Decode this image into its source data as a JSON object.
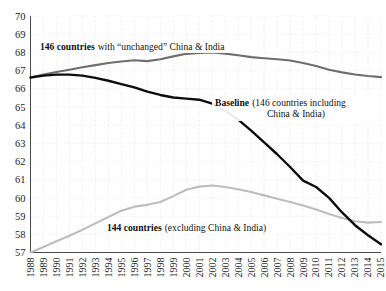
{
  "chart_data": {
    "type": "line",
    "title": "",
    "xlabel": "",
    "ylabel": "",
    "xlim": [
      1988,
      2015
    ],
    "ylim": [
      57,
      70
    ],
    "grid": true,
    "legend_position": "inline-annotations",
    "x": [
      1988,
      1989,
      1990,
      1991,
      1992,
      1993,
      1994,
      1995,
      1996,
      1997,
      1998,
      1999,
      2000,
      2001,
      2002,
      2003,
      2004,
      2005,
      2006,
      2007,
      2008,
      2009,
      2010,
      2011,
      2012,
      2013,
      2014,
      2015
    ],
    "xticklabels": [
      "1988",
      "1989",
      "1990",
      "1991",
      "1992",
      "1993",
      "1994",
      "1995",
      "1996",
      "1997",
      "1998",
      "1999",
      "2000",
      "2001",
      "2002",
      "2003",
      "2004",
      "2005",
      "2006",
      "2007",
      "2008",
      "2009",
      "2010",
      "2011",
      "2012",
      "2013",
      "2014",
      "2015"
    ],
    "yticks": [
      57,
      58,
      59,
      60,
      61,
      62,
      63,
      64,
      65,
      66,
      67,
      68,
      69,
      70
    ],
    "yticklabels": [
      "57",
      "58",
      "59",
      "60",
      "61",
      "62",
      "63",
      "64",
      "65",
      "66",
      "67",
      "68",
      "69",
      "70"
    ],
    "series": [
      {
        "name": "146 countries with \"unchanged\" China & India",
        "color": "#6e6e6e",
        "width": 2.1,
        "values": [
          66.62,
          66.78,
          66.92,
          67.05,
          67.18,
          67.3,
          67.42,
          67.5,
          67.57,
          67.52,
          67.62,
          67.78,
          67.92,
          67.97,
          67.99,
          67.93,
          67.84,
          67.74,
          67.68,
          67.62,
          67.55,
          67.42,
          67.25,
          67.05,
          66.9,
          66.78,
          66.7,
          66.64
        ]
      },
      {
        "name": "Baseline (146 countries including China & India)",
        "color": "#0d0d0d",
        "width": 2.4,
        "values": [
          66.62,
          66.72,
          66.78,
          66.78,
          66.72,
          66.6,
          66.44,
          66.26,
          66.08,
          65.84,
          65.66,
          65.52,
          65.46,
          65.4,
          65.18,
          64.8,
          64.3,
          63.7,
          63.05,
          62.4,
          61.7,
          60.95,
          60.6,
          60.0,
          59.2,
          58.5,
          57.95,
          57.45
        ]
      },
      {
        "name": "144 countries (excluding China & India)",
        "color": "#bdbdbd",
        "width": 2.1,
        "values": [
          57.0,
          57.3,
          57.62,
          57.92,
          58.25,
          58.6,
          58.95,
          59.3,
          59.52,
          59.62,
          59.78,
          60.1,
          60.45,
          60.62,
          60.68,
          60.6,
          60.48,
          60.32,
          60.14,
          59.96,
          59.78,
          59.58,
          59.36,
          59.12,
          58.9,
          58.72,
          58.64,
          58.68
        ]
      }
    ],
    "annotations": [
      {
        "id": "annotation-unchanged",
        "bold_text": "146 countries",
        "regular_text": "with “unchanged” China & India",
        "lines": [
          "146 countries with “unchanged” China & India"
        ]
      },
      {
        "id": "annotation-baseline",
        "bold_text": "Baseline",
        "regular_text": "(146 countries including",
        "second_line": "China & India)"
      },
      {
        "id": "annotation-excluding",
        "bold_text": "144 countries",
        "regular_text": "(excluding China & India)"
      }
    ]
  },
  "colors": {
    "background": "#ffffff",
    "axis": "#4a4a4a",
    "grid": "#dcdcdc",
    "series_unchanged": "#6e6e6e",
    "series_baseline": "#0d0d0d",
    "series_excluding": "#bdbdbd"
  }
}
